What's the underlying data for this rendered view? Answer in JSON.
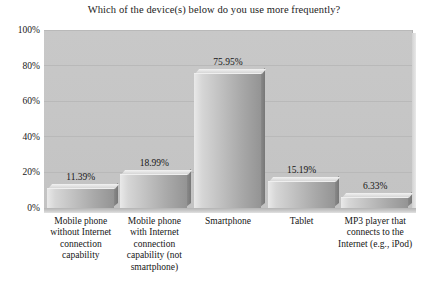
{
  "chart_data": {
    "type": "bar",
    "title": "Which of the device(s) below do you use more frequently?",
    "xlabel": "",
    "ylabel": "",
    "ylim": [
      0,
      100
    ],
    "yticks": [
      "0%",
      "20%",
      "40%",
      "60%",
      "80%",
      "100%"
    ],
    "ytick_values": [
      0,
      20,
      40,
      60,
      80,
      100
    ],
    "grid": true,
    "legend": "none",
    "style": "3d-bar",
    "categories": [
      "Mobile phone without Internet connection capability",
      "Mobile phone with Internet connection capability (not smartphone)",
      "Smartphone",
      "Tablet",
      "MP3 player that connects to the Internet (e.g., iPod)"
    ],
    "category_lines": [
      [
        "Mobile phone",
        "without Internet",
        "connection",
        "capability"
      ],
      [
        "Mobile phone",
        "with Internet",
        "connection",
        "capability (not",
        "smartphone)"
      ],
      [
        "Smartphone"
      ],
      [
        "Tablet"
      ],
      [
        "MP3 player that",
        "connects to the",
        "Internet (e.g., iPod)"
      ]
    ],
    "values": [
      11.39,
      18.99,
      75.95,
      15.19,
      6.33
    ],
    "data_labels": [
      "11.39%",
      "18.99%",
      "75.95%",
      "15.19%",
      "6.33%"
    ],
    "colors": {
      "plot_background": "#c6c6c6",
      "bar_light": "#e9e9e9",
      "bar_dark": "#949494",
      "gridline": "#b9b9b9",
      "text": "#161616",
      "page_background": "#ffffff"
    }
  }
}
